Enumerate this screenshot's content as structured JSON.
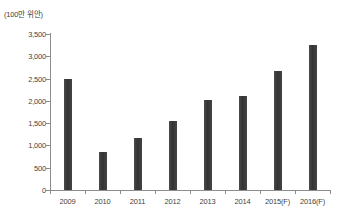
{
  "chart_data": {
    "type": "bar",
    "title": "",
    "subtitle": "",
    "unit_label": "(100만 위안)",
    "xlabel": "",
    "ylabel": "",
    "categories": [
      "2009",
      "2010",
      "2011",
      "2012",
      "2013",
      "2014",
      "2015(F)",
      "2016(F)"
    ],
    "values": [
      2490,
      860,
      1160,
      1540,
      2030,
      2110,
      2680,
      3260
    ],
    "series": [
      {
        "name": "",
        "values": [
          2490,
          860,
          1160,
          1540,
          2030,
          2110,
          2680,
          3260
        ]
      }
    ],
    "ylim": [
      0,
      3500
    ],
    "y_ticks": [
      0,
      500,
      1000,
      1500,
      2000,
      2500,
      3000,
      3500
    ],
    "y_tick_labels": [
      "0",
      "500",
      "1,000",
      "1,500",
      "2,000",
      "2,500",
      "3,000",
      "3,500"
    ],
    "grid": false,
    "legend": false,
    "legend_position": "none",
    "bar_color": "#3b3b3b",
    "axis_color": "#8c8c8c",
    "background_color": "#ffffff"
  }
}
